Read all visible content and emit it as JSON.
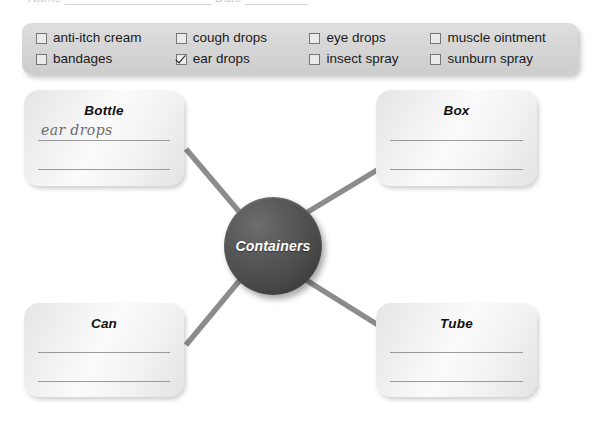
{
  "page": {
    "cutoff_header_text": "Name _____________________  Date _________",
    "background_color": "#ffffff"
  },
  "word_bank": {
    "panel_color": "#d7d7d7",
    "columns": [
      {
        "items": [
          {
            "label": "anti-itch cream",
            "checked": false
          },
          {
            "label": "bandages",
            "checked": false
          }
        ]
      },
      {
        "items": [
          {
            "label": "cough drops",
            "checked": false
          },
          {
            "label": "ear drops",
            "checked": true
          }
        ]
      },
      {
        "items": [
          {
            "label": "eye drops",
            "checked": false
          },
          {
            "label": "insect spray",
            "checked": false
          }
        ]
      },
      {
        "items": [
          {
            "label": "muscle ointment",
            "checked": false
          },
          {
            "label": "sunburn spray",
            "checked": false
          }
        ]
      }
    ]
  },
  "diagram": {
    "center": {
      "label": "Containers",
      "fill_color": "#4a4a4a",
      "text_color": "#ffffff"
    },
    "connector_color": "#8c8c8c",
    "nodes": [
      {
        "id": "bottle",
        "title": "Bottle",
        "answers": [
          "ear drops",
          ""
        ]
      },
      {
        "id": "box",
        "title": "Box",
        "answers": [
          "",
          ""
        ]
      },
      {
        "id": "can",
        "title": "Can",
        "answers": [
          "",
          ""
        ]
      },
      {
        "id": "tube",
        "title": "Tube",
        "answers": [
          "",
          ""
        ]
      }
    ]
  }
}
